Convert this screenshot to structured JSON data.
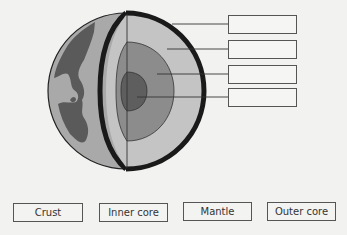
{
  "diagram": {
    "colors": {
      "background": "#f2f2f0",
      "ocean": "#a9a9a9",
      "land": "#5a5a5a",
      "crust_outline": "#1a1a1a",
      "mantle": "#c4c4c4",
      "outer_core": "#8c8c8c",
      "inner_core": "#5e5e5e"
    },
    "answer_boxes": [
      {
        "id": "box-1",
        "value": ""
      },
      {
        "id": "box-2",
        "value": ""
      },
      {
        "id": "box-3",
        "value": ""
      },
      {
        "id": "box-4",
        "value": ""
      }
    ]
  },
  "word_bank": [
    {
      "label": "Crust"
    },
    {
      "label": "Inner core"
    },
    {
      "label": "Mantle"
    },
    {
      "label": "Outer core"
    }
  ]
}
